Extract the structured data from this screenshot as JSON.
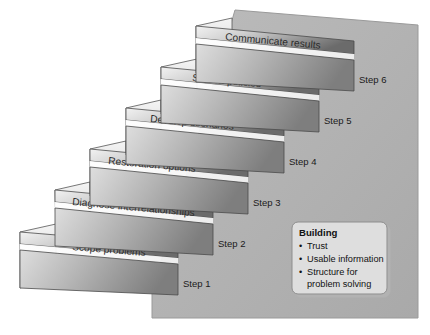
{
  "diagram": {
    "background_color": "#b5b5b5",
    "step_face_light": "#e9e9e9",
    "step_face_dark": "#6f6f6f",
    "riser_light": "#d8d8d8",
    "riser_dark": "#7a7a7a",
    "outline_color": "#3a3a3a",
    "text_color": "#222222"
  },
  "steps": [
    {
      "label": "Scope problems",
      "marker": "Step 1"
    },
    {
      "label": "Diagnose interrelationships",
      "marker": "Step 2"
    },
    {
      "label": "Restoration options",
      "marker": "Step 3"
    },
    {
      "label": "Develop scenarios",
      "marker": "Step 4"
    },
    {
      "label": "Screen policies",
      "marker": "Step 5"
    },
    {
      "label": "Communicate results",
      "marker": "Step 6"
    }
  ],
  "callout": {
    "title": "Building",
    "items": [
      "Trust",
      "Usable information",
      "Structure for",
      "problem solving"
    ],
    "bullet": "•",
    "fill": "#d9d9d9",
    "border": "#8a8a8a"
  }
}
